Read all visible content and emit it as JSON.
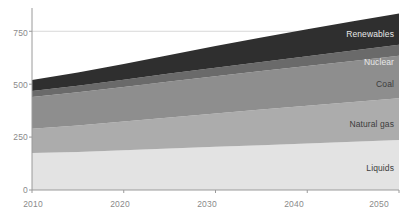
{
  "chart_data": {
    "type": "area",
    "title": "",
    "xlabel": "",
    "ylabel": "",
    "x": [
      2010,
      2015,
      2020,
      2025,
      2030,
      2035,
      2040,
      2045,
      2050
    ],
    "xlim": [
      2010,
      2050
    ],
    "ylim": [
      0,
      860
    ],
    "xticks": [
      "2010",
      "2020",
      "2030",
      "2040",
      "2050"
    ],
    "yticks": [
      "0",
      "250",
      "500",
      "750"
    ],
    "grid": true,
    "stacked": true,
    "legend_position": "inline-right",
    "series": [
      {
        "name": "Liquids",
        "color": "#e3e3e3",
        "values": [
          175,
          180,
          188,
          196,
          204,
          212,
          220,
          228,
          236
        ]
      },
      {
        "name": "Natural gas",
        "color": "#acacac",
        "values": [
          115,
          125,
          136,
          147,
          158,
          168,
          178,
          188,
          198
        ]
      },
      {
        "name": "Coal",
        "color": "#8e8e8e",
        "values": [
          150,
          157,
          163,
          170,
          176,
          182,
          188,
          194,
          200
        ]
      },
      {
        "name": "Nuclear",
        "color": "#6a6a6a",
        "values": [
          28,
          31,
          34,
          37,
          40,
          43,
          46,
          49,
          52
        ]
      },
      {
        "name": "Renewables",
        "color": "#2f2f2f",
        "values": [
          52,
          62,
          74,
          88,
          103,
          116,
          128,
          138,
          148
        ]
      }
    ],
    "totals": [
      520,
      555,
      595,
      638,
      681,
      721,
      760,
      797,
      834
    ]
  },
  "axis": {
    "yticks": [
      {
        "label": "750",
        "value": 750
      },
      {
        "label": "500",
        "value": 500
      },
      {
        "label": "250",
        "value": 250
      },
      {
        "label": "0",
        "value": 0
      }
    ],
    "xticks": [
      {
        "label": "2010",
        "value": 2010
      },
      {
        "label": "2020",
        "value": 2020
      },
      {
        "label": "2030",
        "value": 2030
      },
      {
        "label": "2040",
        "value": 2040
      },
      {
        "label": "2050",
        "value": 2050
      }
    ]
  },
  "labels": {
    "renewables": "Renewables",
    "nuclear": "Nuclear",
    "coal": "Coal",
    "natural_gas": "Natural gas",
    "liquids": "Liquids"
  },
  "colors": {
    "renewables": "#2f2f2f",
    "nuclear": "#6a6a6a",
    "coal": "#8e8e8e",
    "natural_gas": "#acacac",
    "liquids": "#e3e3e3",
    "axis": "#9a9a9a",
    "grid": "#d8d8d8",
    "tick_text": "#8a8a8a"
  }
}
